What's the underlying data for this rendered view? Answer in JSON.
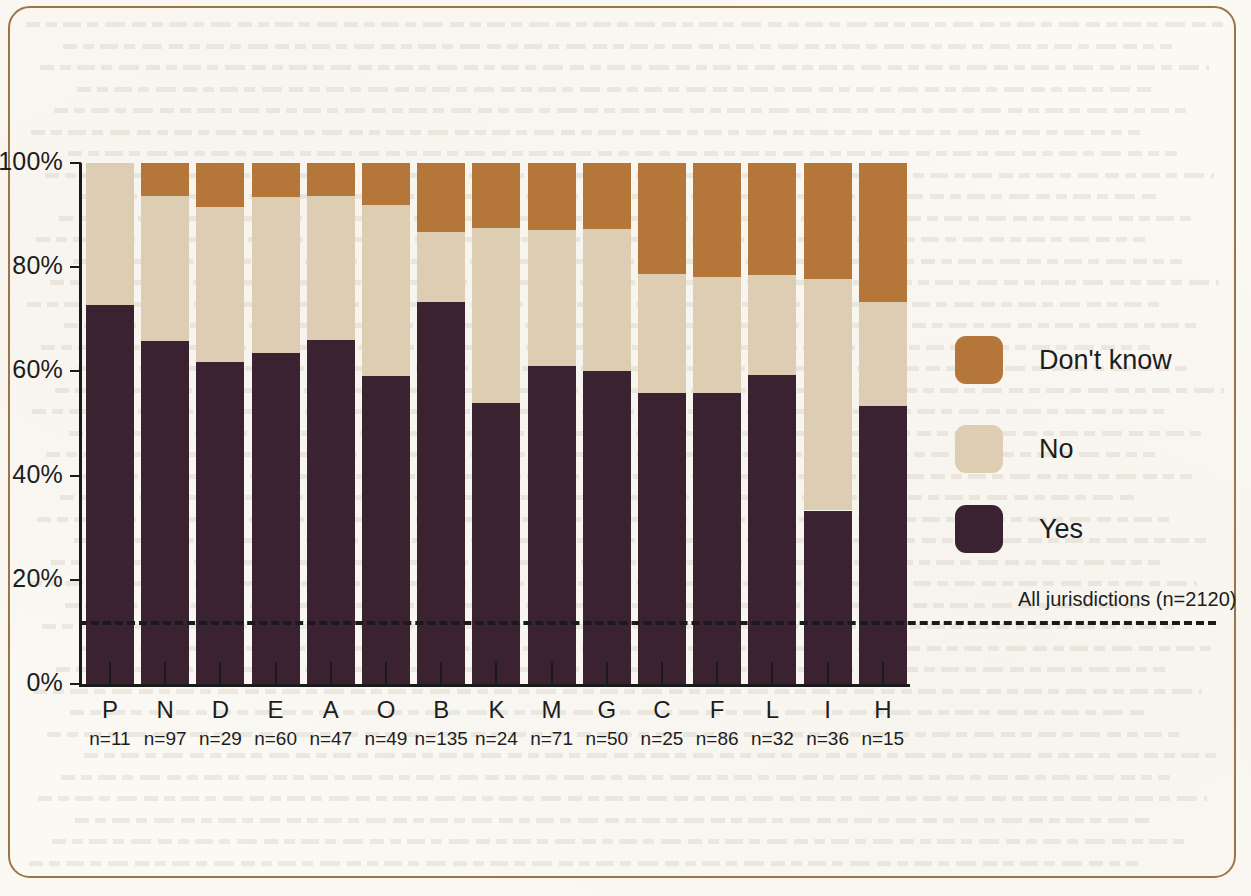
{
  "chart_data": {
    "type": "bar",
    "subtype": "stacked-100-percent",
    "title": "",
    "xlabel": "",
    "ylabel": "",
    "ylim": [
      0,
      100
    ],
    "ytick_labels": [
      "0%",
      "20%",
      "40%",
      "60%",
      "80%",
      "100%"
    ],
    "ytick_values": [
      0,
      20,
      40,
      60,
      80,
      100
    ],
    "grid": false,
    "legend_position": "right",
    "categories": [
      "P",
      "N",
      "D",
      "E",
      "A",
      "O",
      "B",
      "K",
      "M",
      "G",
      "C",
      "F",
      "L",
      "I",
      "H"
    ],
    "category_sublabels": [
      "n=11",
      "n=97",
      "n=29",
      "n=60",
      "n=47",
      "n=49",
      "n=135",
      "n=24",
      "n=71",
      "n=50",
      "n=25",
      "n=86",
      "n=32",
      "n=36",
      "n=15"
    ],
    "sample_sizes": [
      11,
      97,
      29,
      60,
      47,
      49,
      135,
      24,
      71,
      50,
      25,
      86,
      32,
      36,
      15
    ],
    "series": [
      {
        "name": "Yes",
        "color": "#3a2230",
        "values": [
          72.7,
          65.9,
          61.8,
          63.6,
          66.0,
          59.2,
          73.3,
          54.0,
          61.0,
          60.0,
          55.8,
          55.8,
          59.4,
          33.3,
          53.3
        ]
      },
      {
        "name": "No",
        "color": "#ddcdb3",
        "values": [
          27.3,
          27.8,
          29.8,
          29.8,
          27.6,
          32.7,
          13.4,
          33.6,
          26.2,
          27.4,
          22.8,
          22.4,
          19.1,
          44.4,
          20.0
        ]
      },
      {
        "name": "Don't know",
        "color": "#b5763a",
        "values": [
          0.0,
          6.3,
          8.4,
          6.6,
          6.4,
          8.1,
          13.3,
          12.4,
          12.8,
          12.6,
          21.4,
          21.8,
          21.5,
          22.3,
          26.7
        ]
      }
    ],
    "reference_line": {
      "label": "All jurisdictions (n=2120)",
      "value": 12,
      "n": 2120,
      "style": "dashed",
      "color": "#1a1a1a"
    }
  },
  "legend": {
    "entries": [
      {
        "label": "Don't know",
        "color": "#b5763a"
      },
      {
        "label": "No",
        "color": "#ddcdb3"
      },
      {
        "label": "Yes",
        "color": "#3a2230"
      }
    ]
  },
  "frame": {
    "border_color": "#9c7448"
  },
  "palette": {
    "dont_know": "#b5763a",
    "no": "#ddcdb3",
    "yes": "#3a2230",
    "axis": "#1a1a1a",
    "background": "#fbf9f4"
  }
}
